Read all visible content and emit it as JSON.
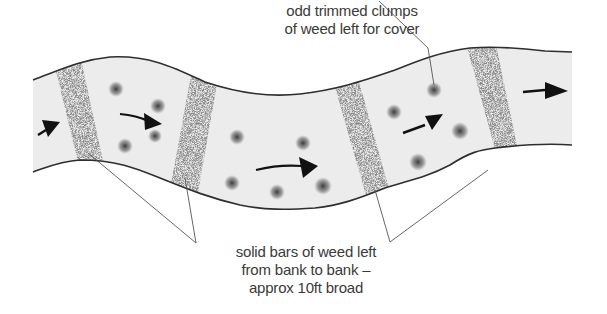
{
  "diagram": {
    "type": "river weed-cutting plan",
    "colors": {
      "water": "#ececec",
      "bank_line": "#2e2e2e",
      "weed_dots": "#4a4a4a",
      "arrow": "#111111",
      "leader_line": "#555555",
      "label_text": "#3a3a3a"
    },
    "labels": {
      "clumps": {
        "line1": "odd trimmed clumps",
        "line2": "of weed left for cover"
      },
      "bars": {
        "line1": "solid bars of weed left",
        "line2": "from bank to bank –",
        "line3": "approx 10ft broad"
      }
    },
    "flow_arrows": 5,
    "weed_bars": 4,
    "weed_clumps": 12
  }
}
